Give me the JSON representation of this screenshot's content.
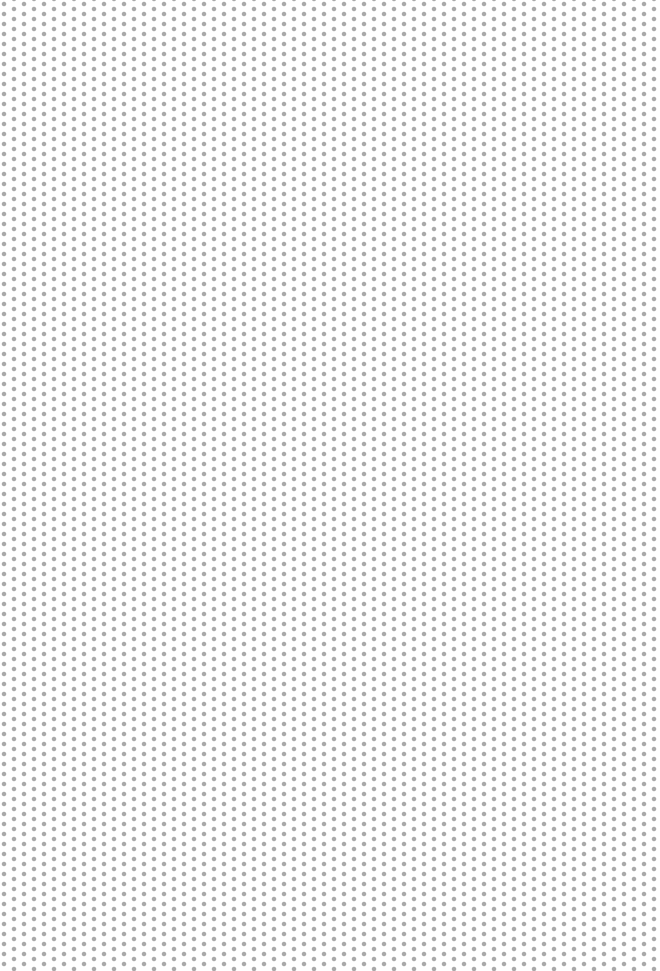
{
  "canvas": {
    "width": 660,
    "height": 971,
    "background_color": "#ffffff"
  },
  "pattern": {
    "type": "staggered-dot-grid",
    "dot_color": "#a9a9a9",
    "dot_diameter_px": 4,
    "column_spacing_px": 10,
    "row_spacing_px": 10,
    "alternate_column_offset_px": 5
  }
}
